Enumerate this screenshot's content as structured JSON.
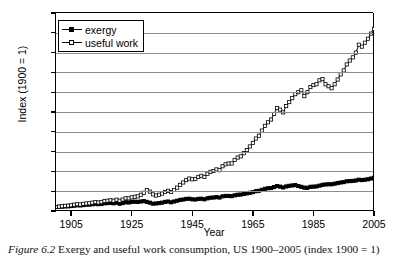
{
  "figure": {
    "number": "Figure 6.2",
    "caption": "Exergy and useful work consumption, US 1900–2005 (index 1900 = 1)"
  },
  "axes": {
    "ylabel": "Index (1900 = 1)",
    "xlabel": "Year",
    "yticks": [
      0,
      5,
      10,
      15,
      20,
      25,
      30,
      35,
      40,
      45,
      50
    ],
    "xticks": [
      1905,
      1925,
      1945,
      1965,
      1985,
      2005
    ],
    "ylim": [
      0,
      50
    ],
    "xlim": [
      1900,
      2005
    ],
    "grid": "horizontal"
  },
  "legend": {
    "position": "top-left-inside",
    "entries": [
      {
        "label": "exergy",
        "marker": "filled-square"
      },
      {
        "label": "useful work",
        "marker": "open-square"
      }
    ]
  },
  "colors": {
    "line": "#000000",
    "grid": "#8e8e8e",
    "background": "#ffffff"
  },
  "chart_data": {
    "type": "line",
    "title": "Exergy and useful work consumption, US 1900–2005 (index 1900 = 1)",
    "xlabel": "Year",
    "ylabel": "Index (1900 = 1)",
    "xlim": [
      1900,
      2005
    ],
    "ylim": [
      0,
      50
    ],
    "grid": true,
    "legend_position": "top-left-inside",
    "x": [
      1900,
      1901,
      1902,
      1903,
      1904,
      1905,
      1906,
      1907,
      1908,
      1909,
      1910,
      1911,
      1912,
      1913,
      1914,
      1915,
      1916,
      1917,
      1918,
      1919,
      1920,
      1921,
      1922,
      1923,
      1924,
      1925,
      1926,
      1927,
      1928,
      1929,
      1930,
      1931,
      1932,
      1933,
      1934,
      1935,
      1936,
      1937,
      1938,
      1939,
      1940,
      1941,
      1942,
      1943,
      1944,
      1945,
      1946,
      1947,
      1948,
      1949,
      1950,
      1951,
      1952,
      1953,
      1954,
      1955,
      1956,
      1957,
      1958,
      1959,
      1960,
      1961,
      1962,
      1963,
      1964,
      1965,
      1966,
      1967,
      1968,
      1969,
      1970,
      1971,
      1972,
      1973,
      1974,
      1975,
      1976,
      1977,
      1978,
      1979,
      1980,
      1981,
      1982,
      1983,
      1984,
      1985,
      1986,
      1987,
      1988,
      1989,
      1990,
      1991,
      1992,
      1993,
      1994,
      1995,
      1996,
      1997,
      1998,
      1999,
      2000,
      2001,
      2002,
      2003,
      2004,
      2005
    ],
    "series": [
      {
        "name": "exergy",
        "marker": "filled-square",
        "values": [
          1.0,
          1.05,
          1.1,
          1.15,
          1.18,
          1.25,
          1.35,
          1.45,
          1.4,
          1.5,
          1.6,
          1.62,
          1.7,
          1.8,
          1.72,
          1.78,
          1.95,
          2.0,
          2.05,
          1.95,
          2.1,
          1.85,
          2.0,
          2.2,
          2.15,
          2.3,
          2.35,
          2.3,
          2.4,
          2.5,
          2.3,
          2.1,
          1.85,
          1.9,
          2.0,
          2.1,
          2.3,
          2.4,
          2.2,
          2.4,
          2.6,
          2.8,
          2.9,
          3.05,
          3.1,
          2.95,
          2.9,
          3.05,
          3.1,
          2.95,
          3.2,
          3.35,
          3.4,
          3.5,
          3.4,
          3.7,
          3.8,
          3.8,
          3.75,
          3.95,
          4.1,
          4.15,
          4.3,
          4.45,
          4.6,
          4.75,
          5.0,
          5.1,
          5.35,
          5.6,
          5.75,
          5.8,
          6.05,
          6.3,
          6.15,
          5.95,
          6.2,
          6.35,
          6.45,
          6.55,
          6.3,
          6.1,
          5.9,
          5.85,
          6.1,
          6.15,
          6.2,
          6.4,
          6.6,
          6.7,
          6.75,
          6.75,
          6.9,
          7.05,
          7.2,
          7.3,
          7.5,
          7.55,
          7.6,
          7.7,
          7.9,
          7.8,
          7.9,
          8.0,
          8.2,
          8.4
        ]
      },
      {
        "name": "useful work",
        "marker": "open-square",
        "values": [
          1.0,
          1.1,
          1.2,
          1.3,
          1.35,
          1.45,
          1.6,
          1.7,
          1.65,
          1.8,
          1.9,
          1.95,
          2.1,
          2.25,
          2.15,
          2.25,
          2.5,
          2.6,
          2.7,
          2.6,
          2.85,
          2.6,
          2.9,
          3.2,
          3.2,
          3.45,
          3.6,
          3.7,
          4.1,
          4.6,
          5.3,
          4.9,
          4.2,
          3.9,
          4.1,
          4.4,
          4.8,
          5.1,
          4.8,
          5.3,
          5.9,
          6.6,
          7.2,
          7.8,
          8.2,
          8.0,
          8.1,
          8.6,
          8.9,
          8.6,
          9.4,
          9.9,
          10.1,
          10.5,
          10.3,
          11.3,
          11.8,
          12.0,
          12.0,
          12.9,
          13.5,
          13.8,
          14.6,
          15.4,
          16.3,
          17.2,
          18.3,
          19.0,
          20.3,
          21.5,
          22.4,
          23.1,
          24.5,
          26.0,
          25.6,
          24.9,
          26.5,
          27.5,
          28.5,
          29.5,
          30.0,
          30.5,
          29.0,
          30.0,
          31.3,
          31.8,
          32.0,
          33.0,
          33.3,
          32.0,
          31.5,
          31.0,
          32.0,
          33.2,
          34.5,
          35.5,
          37.0,
          38.0,
          38.8,
          40.0,
          42.0,
          41.5,
          42.5,
          43.5,
          44.8,
          46.0
        ]
      }
    ]
  }
}
